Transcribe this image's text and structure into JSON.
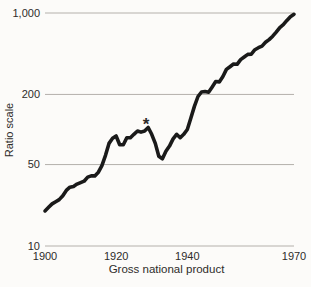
{
  "figure": {
    "background": "#fcfbf9"
  },
  "chart_data": {
    "type": "line",
    "title": "",
    "xlabel": "Gross national product",
    "ylabel": "Ratio scale",
    "y_scale": "log",
    "xlim": [
      1900,
      1970
    ],
    "ylim": [
      10,
      1000
    ],
    "grid": "horizontal-only",
    "legend": "none",
    "x_ticks": [
      {
        "value": 1900,
        "label": "1900"
      },
      {
        "value": 1920,
        "label": "1920"
      },
      {
        "value": 1940,
        "label": "1940"
      },
      {
        "value": 1970,
        "label": "1970"
      }
    ],
    "y_ticks": [
      {
        "value": 10,
        "label": "10"
      },
      {
        "value": 50,
        "label": "50"
      },
      {
        "value": 200,
        "label": "200"
      },
      {
        "value": 1000,
        "label": "1,000"
      }
    ],
    "series": [
      {
        "name": "Gross national product (ratio scale)",
        "years": [
          1900,
          1901,
          1902,
          1903,
          1904,
          1905,
          1906,
          1907,
          1908,
          1909,
          1910,
          1911,
          1912,
          1913,
          1914,
          1915,
          1916,
          1917,
          1918,
          1919,
          1920,
          1921,
          1922,
          1923,
          1924,
          1925,
          1926,
          1927,
          1928,
          1929,
          1930,
          1931,
          1932,
          1933,
          1934,
          1935,
          1936,
          1937,
          1938,
          1939,
          1940,
          1941,
          1942,
          1943,
          1944,
          1945,
          1946,
          1947,
          1948,
          1949,
          1950,
          1951,
          1952,
          1953,
          1954,
          1955,
          1956,
          1957,
          1958,
          1959,
          1960,
          1961,
          1962,
          1963,
          1964,
          1965,
          1966,
          1967,
          1968,
          1969,
          1970
        ],
        "values": [
          20,
          21.5,
          23,
          24,
          25,
          27,
          30,
          32,
          32.5,
          34,
          35,
          36,
          39,
          40,
          40,
          43,
          49,
          60,
          76,
          84,
          88,
          74,
          74,
          85,
          85,
          91,
          97,
          95,
          97,
          104,
          91,
          76,
          59,
          56,
          65,
          72,
          83,
          91,
          85,
          91,
          100,
          125,
          158,
          192,
          210,
          212,
          209,
          232,
          258,
          256,
          285,
          328,
          346,
          365,
          363,
          398,
          419,
          441,
          444,
          484,
          504,
          520,
          560,
          591,
          632,
          685,
          750,
          794,
          864,
          930,
          975
        ]
      }
    ],
    "annotation": {
      "symbol": "*",
      "year": 1929,
      "value": 104
    },
    "colors": {
      "line": "#1a1a1a",
      "grid": "#b4b0ab",
      "text": "#2e2c2a"
    }
  }
}
